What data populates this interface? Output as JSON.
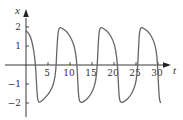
{
  "chart_data": {
    "type": "line",
    "title": "",
    "xlabel": "t",
    "ylabel": "x",
    "xlim": [
      0,
      33
    ],
    "ylim": [
      -2.6,
      2.9
    ],
    "x_ticks": [
      5,
      10,
      15,
      20,
      25,
      30
    ],
    "x_tick_labels": [
      "5",
      "10",
      "15",
      "20",
      "25",
      "30"
    ],
    "y_ticks": [
      -2,
      -1,
      1,
      2
    ],
    "y_tick_labels": [
      "−2",
      "−1",
      "1",
      "2"
    ],
    "grid": false,
    "legend": null,
    "series": [
      {
        "name": "x(t)",
        "color": "#666666",
        "description": "relaxation oscillation, period ~9, amplitude ~2",
        "points": [
          [
            0,
            1.8
          ],
          [
            0.5,
            1.7
          ],
          [
            1,
            1.5
          ],
          [
            1.5,
            1.1
          ],
          [
            2,
            0.4
          ],
          [
            2.3,
            -0.5
          ],
          [
            2.5,
            -1.5
          ],
          [
            2.8,
            -2.0
          ],
          [
            3.5,
            -1.9
          ],
          [
            4.5,
            -1.7
          ],
          [
            5.5,
            -1.4
          ],
          [
            6.3,
            -1.0
          ],
          [
            6.8,
            -0.3
          ],
          [
            7.0,
            0.8
          ],
          [
            7.3,
            1.8
          ],
          [
            7.7,
            2.0
          ],
          [
            8.5,
            1.9
          ],
          [
            9.5,
            1.7
          ],
          [
            10.5,
            1.3
          ],
          [
            11.2,
            0.8
          ],
          [
            11.6,
            0
          ],
          [
            11.8,
            -1.0
          ],
          [
            12.0,
            -1.8
          ],
          [
            12.4,
            -2.0
          ],
          [
            13.3,
            -1.9
          ],
          [
            14.3,
            -1.7
          ],
          [
            15.3,
            -1.3
          ],
          [
            15.9,
            -0.8
          ],
          [
            16.2,
            0
          ],
          [
            16.4,
            1.0
          ],
          [
            16.6,
            1.8
          ],
          [
            17.0,
            2.0
          ],
          [
            17.8,
            1.9
          ],
          [
            18.8,
            1.7
          ],
          [
            19.8,
            1.3
          ],
          [
            20.4,
            0.8
          ],
          [
            20.8,
            0
          ],
          [
            21.0,
            -1.0
          ],
          [
            21.2,
            -1.8
          ],
          [
            21.6,
            -2.0
          ],
          [
            22.5,
            -1.9
          ],
          [
            23.5,
            -1.7
          ],
          [
            24.5,
            -1.3
          ],
          [
            25.1,
            -0.8
          ],
          [
            25.4,
            0
          ],
          [
            25.6,
            1.0
          ],
          [
            25.8,
            1.8
          ],
          [
            26.2,
            2.0
          ],
          [
            27.0,
            1.9
          ],
          [
            28.0,
            1.7
          ],
          [
            29.0,
            1.3
          ],
          [
            29.6,
            0.8
          ],
          [
            29.9,
            0
          ],
          [
            30.1,
            -1.0
          ],
          [
            30.3,
            -1.8
          ],
          [
            30.6,
            -2.0
          ]
        ]
      }
    ]
  }
}
